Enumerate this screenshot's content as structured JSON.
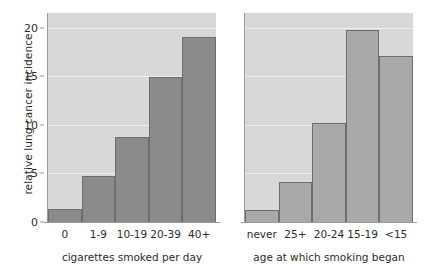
{
  "chart_data": {
    "type": "bar",
    "title": "",
    "subtitle": "",
    "ylabel": "relative lung cancer incidence",
    "ylim": [
      0,
      21.5
    ],
    "yticks": [
      0,
      5,
      10,
      15,
      20
    ],
    "ytick_labels": [
      "0",
      "5",
      "10",
      "15",
      "20"
    ],
    "grid": true,
    "legend": "none",
    "panels": [
      {
        "xlabel": "cigarettes smoked per day",
        "categories": [
          "0",
          "1-9",
          "10-19",
          "20-39",
          "40+"
        ],
        "values": [
          1.3,
          4.7,
          8.7,
          14.9,
          19.0
        ],
        "bar_color": "#8b8b8b"
      },
      {
        "xlabel": "age at which smoking began",
        "categories": [
          "never",
          "25+",
          "20-24",
          "15-19",
          "<15"
        ],
        "values": [
          1.2,
          4.1,
          10.2,
          19.8,
          17.1
        ],
        "bar_color": "#a9a9a9"
      }
    ],
    "panel_background": "#d8d8d8",
    "gridline_color": "#eeeeee",
    "axis_color": "#9a9a9a",
    "bar_edge_color": "#6e6e6e",
    "text_color": "#2b2b2b"
  }
}
